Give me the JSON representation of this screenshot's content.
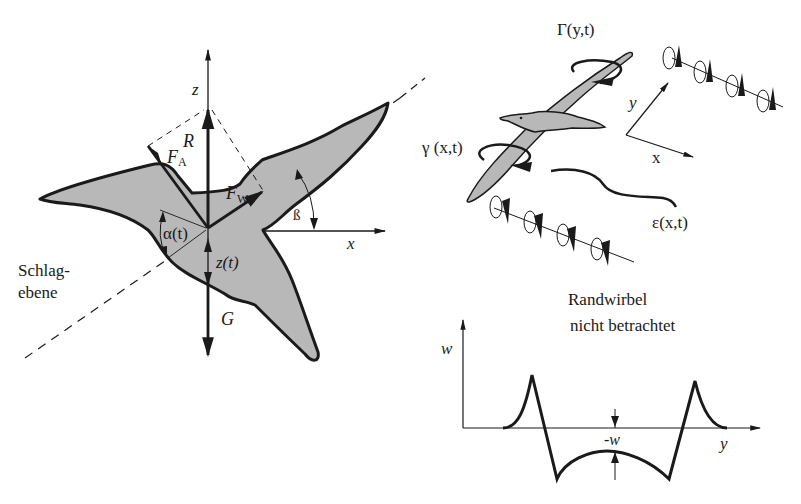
{
  "left_panel": {
    "title": "Force diagram of flapping bird",
    "labels": {
      "z_axis": "z",
      "x_axis": "x",
      "resultant": "R",
      "lift_force": "F",
      "lift_sub": "A",
      "drag_force": "F",
      "drag_sub": "W",
      "angle_alpha": "α(t)",
      "angle_beta": "ß",
      "heave": "z(t)",
      "weight": "G",
      "stroke_plane_line1": "Schlag-",
      "stroke_plane_line2": "ebene"
    }
  },
  "right_top_panel": {
    "labels": {
      "bound_circulation": "Γ(y,t)",
      "chord_circulation": "γ (x,t)",
      "wake_vorticity": "ε(x,t)",
      "axis_y": "y",
      "axis_x": "x"
    },
    "vortex_rows": [
      {
        "name": "upper-trailing-vortices",
        "count": 4
      },
      {
        "name": "lower-trailing-vortices",
        "count": 4
      }
    ]
  },
  "right_bottom_panel": {
    "note_line1": "Randwirbel",
    "note_line2": "nicht betrachtet",
    "axis_w": "w",
    "axis_y": "y",
    "downwash_label": "-w"
  },
  "colors": {
    "fill": "#b8b8b8",
    "stroke": "#1a1a1a",
    "background": "#ffffff"
  }
}
